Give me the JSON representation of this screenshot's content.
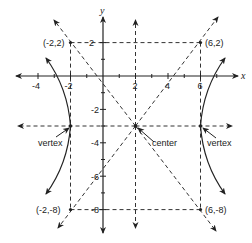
{
  "diagram": {
    "colors": {
      "ink": "#222222",
      "background": "#ffffff"
    },
    "axes": {
      "x_label": "x",
      "y_label": "y",
      "x_ticks": [
        "-4",
        "-2",
        "2",
        "4",
        "6"
      ],
      "y_ticks": [
        "2",
        "-2",
        "-4",
        "-6",
        "-8"
      ]
    },
    "points": {
      "top_left": "(-2,2)",
      "top_right": "(6,2)",
      "bottom_left": "(-2,-8)",
      "bottom_right": "(6,-8)"
    },
    "annotations": {
      "center": "center",
      "left_vertex": "vertex",
      "right_vertex": "vertex"
    },
    "equation_data": {
      "center": [
        2,
        -3
      ],
      "vertices": [
        [
          -2,
          -3
        ],
        [
          6,
          -3
        ]
      ],
      "a": 4,
      "b": 5,
      "orientation": "horizontal"
    }
  }
}
